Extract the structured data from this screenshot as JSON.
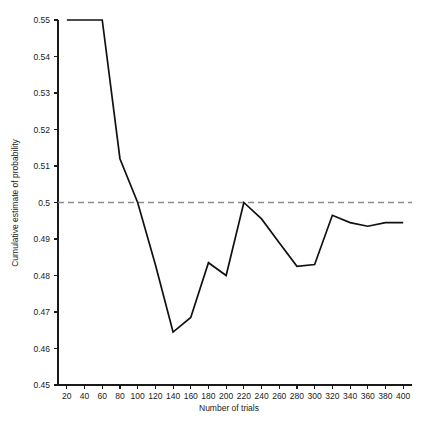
{
  "chart_data": {
    "type": "line",
    "title": "",
    "xlabel": "Number of trials",
    "ylabel": "Cumulative estimate of probability",
    "xlim": [
      10,
      410
    ],
    "ylim": [
      0.45,
      0.55
    ],
    "grid": false,
    "legend": null,
    "x_ticks": [
      20,
      40,
      60,
      80,
      100,
      120,
      140,
      160,
      180,
      200,
      220,
      240,
      260,
      280,
      300,
      320,
      340,
      360,
      380,
      400
    ],
    "x_tick_labels": [
      "20",
      "40",
      "60",
      "80",
      "100",
      "120",
      "140",
      "160",
      "180",
      "200",
      "220",
      "240",
      "260",
      "280",
      "300",
      "320",
      "340",
      "360",
      "380",
      "400"
    ],
    "y_ticks": [
      0.45,
      0.46,
      0.47,
      0.48,
      0.49,
      0.5,
      0.51,
      0.52,
      0.53,
      0.54,
      0.55
    ],
    "y_tick_labels": [
      "0.45",
      "0.46",
      "0.47",
      "0.48",
      "0.49",
      "0.5",
      "0.51",
      "0.52",
      "0.53",
      "0.54",
      "0.55"
    ],
    "x": [
      20,
      40,
      60,
      80,
      100,
      120,
      140,
      160,
      180,
      200,
      220,
      240,
      260,
      280,
      300,
      320,
      340,
      360,
      380,
      400
    ],
    "values": [
      0.55,
      0.55,
      0.55,
      0.512,
      0.5,
      0.483,
      0.4645,
      0.4685,
      0.4835,
      0.48,
      0.5,
      0.4955,
      0.489,
      0.4825,
      0.483,
      0.4965,
      0.4945,
      0.4935,
      0.4945,
      0.4945
    ],
    "series": [
      {
        "name": "Cumulative estimate",
        "color": "#111111",
        "values": [
          0.55,
          0.55,
          0.55,
          0.512,
          0.5,
          0.483,
          0.4645,
          0.4685,
          0.4835,
          0.48,
          0.5,
          0.4955,
          0.489,
          0.4825,
          0.483,
          0.4965,
          0.4945,
          0.4935,
          0.4945,
          0.4945
        ]
      }
    ],
    "reference_lines": [
      {
        "name": "half-probability-line",
        "orientation": "horizontal",
        "value": 0.5,
        "style": "dashed",
        "color": "#8c8c8c"
      }
    ]
  }
}
